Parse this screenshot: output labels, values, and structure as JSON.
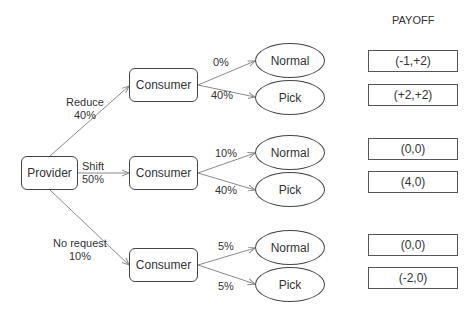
{
  "header": {
    "payoff_title": "PAYOFF"
  },
  "root": {
    "label": "Provider"
  },
  "branches": [
    {
      "action": "Reduce",
      "probability": "40%",
      "node": "Consumer",
      "outcomes": [
        {
          "probability": "0%",
          "label": "Normal",
          "payoff": "(-1,+2)"
        },
        {
          "probability": "40%",
          "label": "Pick",
          "payoff": "(+2,+2)"
        }
      ]
    },
    {
      "action": "Shift",
      "probability": "50%",
      "node": "Consumer",
      "outcomes": [
        {
          "probability": "10%",
          "label": "Normal",
          "payoff": "(0,0)"
        },
        {
          "probability": "40%",
          "label": "Pick",
          "payoff": "(4,0)"
        }
      ]
    },
    {
      "action": "No request",
      "probability": "10%",
      "node": "Consumer",
      "outcomes": [
        {
          "probability": "5%",
          "label": "Normal",
          "payoff": "(0,0)"
        },
        {
          "probability": "5%",
          "label": "Pick",
          "payoff": "(-2,0)"
        }
      ]
    }
  ],
  "colors": {
    "stroke": "#444444",
    "edge": "#8a8a8a",
    "text": "#333333"
  }
}
